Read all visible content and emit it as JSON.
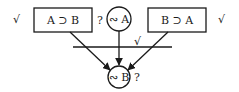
{
  "diagram": {
    "nodes": {
      "left_box": {
        "label": "A ⊃ B",
        "mark_left": "√",
        "mark_right": "?"
      },
      "top_circle": {
        "label": "∾ A"
      },
      "right_box": {
        "label": "B ⊃ A",
        "mark_right": "√"
      },
      "bottom_circle": {
        "label": "∾ B",
        "mark_right": "?"
      }
    },
    "inference_line": {
      "mark": "√"
    },
    "edges": [
      {
        "from": "left_box",
        "to": "bottom_circle"
      },
      {
        "from": "top_circle",
        "to": "bottom_circle"
      },
      {
        "from": "right_box",
        "to": "bottom_circle"
      }
    ]
  }
}
